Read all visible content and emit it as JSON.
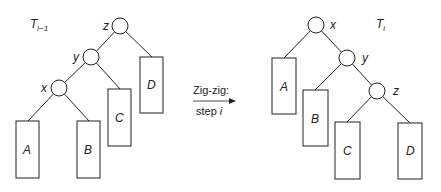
{
  "diagram": {
    "left_tree": {
      "label_main": "T",
      "label_sub": "i−1",
      "nodes": {
        "z": "z",
        "y": "y",
        "x": "x"
      },
      "subtrees": {
        "A": "A",
        "B": "B",
        "C": "C",
        "D": "D"
      }
    },
    "right_tree": {
      "label_main": "T",
      "label_sub": "i",
      "nodes": {
        "x": "x",
        "y": "y",
        "z": "z"
      },
      "subtrees": {
        "A": "A",
        "B": "B",
        "C": "C",
        "D": "D"
      }
    },
    "transition": {
      "line1": "Zig-zig:",
      "line2_prefix": "step ",
      "line2_var": "i"
    },
    "colors": {
      "stroke": "#222222",
      "background": "#ffffff"
    }
  }
}
